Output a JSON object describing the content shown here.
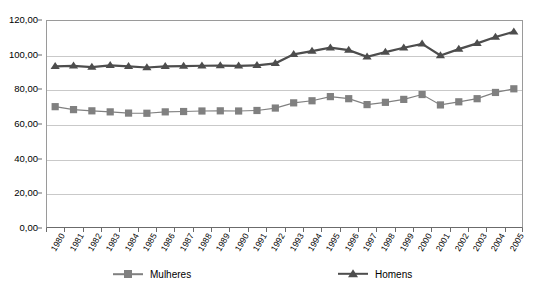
{
  "chart_data": {
    "type": "line",
    "title": "",
    "subtitle": "",
    "xlabel": "",
    "ylabel": "",
    "ylim": [
      0,
      120
    ],
    "ytick_step": 20,
    "grid": true,
    "legend_position": "bottom",
    "ytick_labels": [
      "0,00",
      "20,00",
      "40,00",
      "60,00",
      "80,00",
      "100,00",
      "120,00"
    ],
    "ytick_values": [
      0,
      20,
      40,
      60,
      80,
      100,
      120
    ],
    "categories": [
      "1980",
      "1981",
      "1982",
      "1983",
      "1984",
      "1985",
      "1986",
      "1987",
      "1988",
      "1989",
      "1990",
      "1991",
      "1992",
      "1993",
      "1994",
      "1995",
      "1996",
      "1997",
      "1998",
      "1999",
      "2000",
      "2001",
      "2002",
      "2003",
      "2004",
      "2005"
    ],
    "series": [
      {
        "name": "Mulheres",
        "marker": "square",
        "color": "#808080",
        "values": [
          70.0,
          68.3,
          67.6,
          67.0,
          66.3,
          66.2,
          67.0,
          67.2,
          67.5,
          67.6,
          67.5,
          67.8,
          69.2,
          72.2,
          73.4,
          75.8,
          74.6,
          71.2,
          72.5,
          74.2,
          77.0,
          71.0,
          72.8,
          74.6,
          78.2,
          80.3
        ]
      },
      {
        "name": "Homens",
        "marker": "triangle",
        "color": "#4d4d4d",
        "values": [
          93.2,
          93.5,
          92.8,
          93.8,
          93.2,
          92.6,
          93.3,
          93.4,
          93.6,
          93.7,
          93.5,
          93.8,
          95.0,
          100.2,
          102.0,
          104.0,
          102.6,
          98.8,
          101.5,
          104.0,
          106.2,
          99.5,
          103.2,
          106.5,
          110.2,
          113.2
        ]
      }
    ]
  },
  "legend": {
    "items": [
      {
        "label": "Mulheres",
        "marker": "square",
        "color": "#808080"
      },
      {
        "label": "Homens",
        "marker": "triangle",
        "color": "#4d4d4d"
      }
    ]
  }
}
